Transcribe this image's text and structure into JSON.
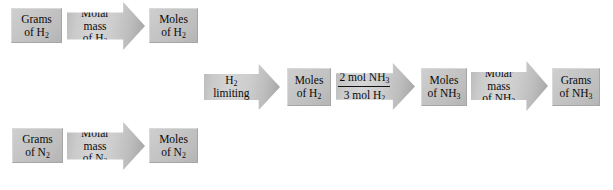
{
  "diagram": {
    "colors": {
      "box_fill": "#c6c6c6",
      "arrow_fill": "#cdcdcd",
      "text": "#0a0a0a",
      "background": "#ffffff"
    },
    "top_branch": {
      "start_box": {
        "line1": "Grams",
        "line2": "of H",
        "sub2": "2"
      },
      "conversion_arrow": {
        "line1": "Molar",
        "line2": "mass",
        "line3": "of H",
        "sub3": "2"
      },
      "end_box": {
        "line1": "Moles",
        "line2": "of H",
        "sub2": "2"
      }
    },
    "bottom_branch": {
      "start_box": {
        "line1": "Grams",
        "line2": "of N",
        "sub2": "2"
      },
      "conversion_arrow": {
        "line1": "Molar",
        "line2": "mass",
        "line3": "of N",
        "sub3": "2"
      },
      "end_box": {
        "line1": "Moles",
        "line2": "of N",
        "sub2": "2"
      }
    },
    "main_chain": {
      "limiting_arrow": {
        "line1": "H",
        "sub1": "2",
        "line2": "limiting"
      },
      "moles_h2_box": {
        "line1": "Moles",
        "line2": "of H",
        "sub2": "2"
      },
      "mole_ratio_arrow": {
        "numerator_text": "2 mol NH",
        "numerator_sub": "3",
        "denominator_text": "3 mol H",
        "denominator_sub": "2"
      },
      "moles_nh3_box": {
        "line1": "Moles",
        "line2": "of NH",
        "sub2": "3"
      },
      "molar_mass_arrow": {
        "line1": "Molar",
        "line2": "mass",
        "line3": "of NH",
        "sub3": "3"
      },
      "grams_nh3_box": {
        "line1": "Grams",
        "line2": "of NH",
        "sub2": "3"
      }
    }
  }
}
